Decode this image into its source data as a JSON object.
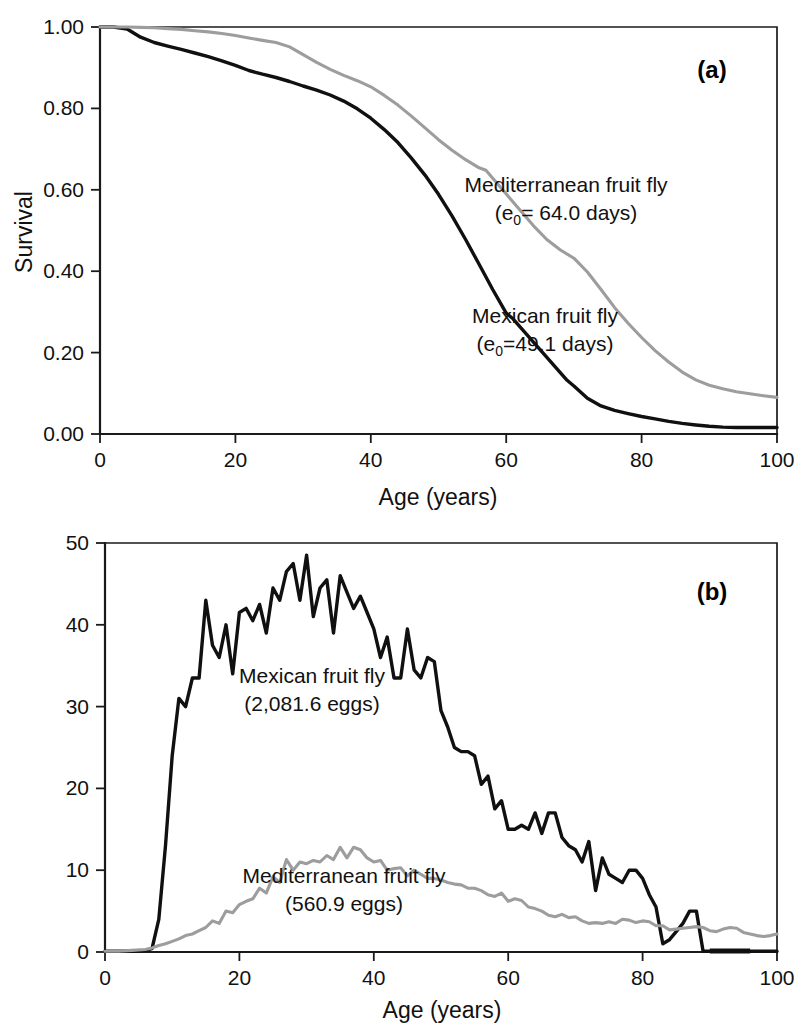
{
  "figure": {
    "panels": [
      {
        "tag": "(a)",
        "xlabel": "Age (years)",
        "ylabel": "Survival",
        "xticks": [
          "0",
          "20",
          "40",
          "60",
          "80",
          "100"
        ],
        "yticks": [
          "0.00",
          "0.20",
          "0.40",
          "0.60",
          "0.80",
          "1.00"
        ],
        "annotations": [
          {
            "line1": "Mediterranean fruit fly",
            "pre": "(e",
            "sub": "0",
            "post": "= 64.0 days)"
          },
          {
            "line1": "Mexican fruit fly",
            "pre": "(e",
            "sub": "0",
            "post": "=49.1 days)"
          }
        ]
      },
      {
        "tag": "(b)",
        "xlabel": "Age (years)",
        "ylabel": "Eggs/female",
        "xticks": [
          "0",
          "20",
          "40",
          "60",
          "80",
          "100"
        ],
        "yticks": [
          "0",
          "10",
          "20",
          "30",
          "40",
          "50"
        ],
        "annotations": [
          {
            "line1": "Mexican fruit fly",
            "line2": "(2,081.6 eggs)"
          },
          {
            "line1": "Mediterranean fruit fly",
            "line2": "(560.9 eggs)"
          }
        ]
      }
    ],
    "colors": {
      "mexican": "#101010",
      "mediterranean": "#9d9d9d",
      "axis": "#1a1a1a"
    }
  },
  "chart_data": [
    {
      "type": "line",
      "panel": "(a)",
      "title": "",
      "xlabel": "Age (years)",
      "ylabel": "Survival",
      "xlim": [
        0,
        100
      ],
      "ylim": [
        0.0,
        1.0
      ],
      "xticks": [
        0,
        20,
        40,
        60,
        80,
        100
      ],
      "yticks": [
        0.0,
        0.2,
        0.4,
        0.6,
        0.8,
        1.0
      ],
      "grid": false,
      "legend": "inline-annotations",
      "series": [
        {
          "name": "Mexican fruit fly",
          "color": "#101010",
          "annotation": "Mexican fruit fly (e0=49.1 days)",
          "life_expectancy_days": 49.1,
          "x": [
            0,
            2,
            4,
            6,
            8,
            10,
            12,
            14,
            16,
            18,
            20,
            22,
            24,
            26,
            28,
            30,
            32,
            34,
            36,
            38,
            40,
            42,
            44,
            46,
            48,
            50,
            52,
            54,
            56,
            58,
            60,
            61,
            69,
            70,
            72,
            74,
            76,
            78,
            80,
            82,
            84,
            86,
            88,
            90,
            92,
            94,
            96,
            98,
            100
          ],
          "y": [
            1.0,
            1.0,
            0.995,
            0.975,
            0.962,
            0.953,
            0.945,
            0.936,
            0.927,
            0.917,
            0.906,
            0.893,
            0.884,
            0.876,
            0.866,
            0.855,
            0.845,
            0.833,
            0.818,
            0.799,
            0.776,
            0.748,
            0.716,
            0.678,
            0.636,
            0.589,
            0.536,
            0.478,
            0.417,
            0.355,
            0.297,
            0.283,
            0.132,
            0.118,
            0.088,
            0.069,
            0.058,
            0.05,
            0.043,
            0.037,
            0.031,
            0.026,
            0.022,
            0.019,
            0.017,
            0.016,
            0.016,
            0.016,
            0.016
          ]
        },
        {
          "name": "Mediterranean fruit fly",
          "color": "#9d9d9d",
          "annotation": "Mediterranean fruit fly (e0= 64.0 days)",
          "life_expectancy_days": 64.0,
          "x": [
            0,
            2,
            4,
            6,
            8,
            10,
            12,
            14,
            16,
            18,
            20,
            22,
            24,
            26,
            28,
            30,
            32,
            34,
            36,
            38,
            40,
            42,
            44,
            46,
            48,
            50,
            52,
            54,
            56,
            57,
            64,
            66,
            68,
            70,
            72,
            74,
            76,
            78,
            80,
            82,
            84,
            86,
            88,
            90,
            92,
            94,
            96,
            98,
            100
          ],
          "y": [
            1.0,
            1.0,
            1.0,
            0.999,
            0.998,
            0.996,
            0.994,
            0.991,
            0.988,
            0.984,
            0.979,
            0.973,
            0.967,
            0.962,
            0.951,
            0.932,
            0.913,
            0.896,
            0.881,
            0.868,
            0.853,
            0.832,
            0.808,
            0.781,
            0.752,
            0.723,
            0.697,
            0.674,
            0.654,
            0.648,
            0.512,
            0.478,
            0.452,
            0.432,
            0.398,
            0.355,
            0.311,
            0.272,
            0.237,
            0.205,
            0.177,
            0.152,
            0.133,
            0.12,
            0.111,
            0.104,
            0.099,
            0.094,
            0.09
          ]
        }
      ]
    },
    {
      "type": "line",
      "panel": "(b)",
      "title": "",
      "xlabel": "Age (years)",
      "ylabel": "Eggs/female",
      "xlim": [
        0,
        100
      ],
      "ylim": [
        0,
        50
      ],
      "xticks": [
        0,
        20,
        40,
        60,
        80,
        100
      ],
      "yticks": [
        0,
        10,
        20,
        30,
        40,
        50
      ],
      "grid": false,
      "legend": "inline-annotations",
      "series": [
        {
          "name": "Mexican fruit fly",
          "color": "#101010",
          "annotation": "Mexican fruit fly (2,081.6 eggs)",
          "total_eggs": 2081.6,
          "x": [
            0,
            2,
            4,
            6,
            7,
            8,
            9,
            10,
            11,
            12,
            13,
            14,
            15,
            16,
            17,
            18,
            19,
            20,
            21,
            22,
            23,
            24,
            25,
            26,
            27,
            28,
            29,
            30,
            31,
            32,
            33,
            34,
            35,
            36,
            37,
            38,
            39,
            40,
            41,
            42,
            43,
            44,
            45,
            46,
            47,
            48,
            49,
            50,
            51,
            52,
            53,
            54,
            55,
            56,
            57,
            58,
            59,
            60,
            61,
            62,
            63,
            64,
            65,
            66,
            67,
            68,
            69,
            70,
            71,
            72,
            73,
            74,
            75,
            76,
            77,
            78,
            79,
            80,
            81,
            82,
            83,
            84,
            85,
            86,
            87,
            88,
            89,
            90,
            92,
            94,
            96,
            98,
            100
          ],
          "y": [
            0.1,
            0.1,
            0.1,
            0.2,
            0.4,
            4.0,
            13.0,
            24.0,
            31.0,
            30.0,
            33.5,
            33.5,
            43.0,
            37.5,
            36.0,
            40.0,
            34.0,
            41.5,
            42.0,
            40.5,
            42.5,
            39.0,
            44.5,
            43.0,
            46.5,
            47.5,
            43.0,
            48.5,
            41.0,
            44.5,
            45.5,
            39.0,
            46.0,
            44.0,
            42.0,
            43.5,
            41.5,
            39.5,
            36.0,
            38.5,
            33.5,
            33.5,
            39.5,
            34.5,
            33.5,
            36.0,
            35.5,
            29.5,
            27.5,
            25.0,
            24.5,
            24.5,
            24.0,
            20.5,
            21.5,
            17.5,
            18.5,
            15.0,
            15.0,
            15.5,
            15.0,
            17.0,
            14.5,
            17.0,
            17.0,
            14.0,
            13.0,
            12.5,
            11.0,
            13.5,
            7.5,
            11.5,
            9.5,
            9.0,
            8.5,
            10.0,
            10.0,
            9.0,
            7.0,
            5.5,
            1.0,
            1.5,
            2.5,
            3.5,
            5.0,
            5.0,
            0.1,
            0.1,
            0.1,
            0.1,
            0.1,
            0.1,
            0.1
          ]
        },
        {
          "name": "Mediterranean fruit fly",
          "color": "#9d9d9d",
          "annotation": "Mediterranean fruit fly (560.9 eggs)",
          "total_eggs": 560.9,
          "x": [
            0,
            2,
            4,
            6,
            7,
            8,
            9,
            10,
            11,
            12,
            13,
            14,
            15,
            16,
            17,
            18,
            19,
            20,
            21,
            22,
            23,
            24,
            25,
            26,
            27,
            28,
            29,
            30,
            31,
            32,
            33,
            34,
            35,
            36,
            37,
            38,
            39,
            40,
            41,
            42,
            43,
            44,
            45,
            46,
            47,
            48,
            49,
            50,
            51,
            52,
            53,
            54,
            55,
            56,
            57,
            58,
            59,
            60,
            61,
            62,
            63,
            64,
            65,
            66,
            67,
            68,
            69,
            70,
            71,
            72,
            73,
            74,
            75,
            76,
            77,
            78,
            79,
            80,
            81,
            82,
            83,
            84,
            85,
            86,
            87,
            88,
            89,
            90,
            91,
            92,
            93,
            94,
            95,
            96,
            97,
            98,
            99,
            100
          ],
          "y": [
            0.1,
            0.1,
            0.2,
            0.3,
            0.5,
            0.8,
            1.0,
            1.3,
            1.6,
            2.0,
            2.2,
            2.6,
            3.0,
            3.8,
            3.5,
            5.0,
            4.8,
            5.8,
            6.2,
            6.5,
            7.8,
            7.2,
            9.2,
            8.5,
            11.3,
            10.0,
            11.0,
            10.8,
            11.2,
            11.0,
            11.8,
            11.3,
            12.8,
            11.5,
            12.8,
            12.5,
            11.5,
            11.0,
            11.2,
            10.0,
            10.2,
            10.3,
            9.3,
            10.0,
            9.5,
            9.0,
            9.0,
            8.8,
            8.5,
            8.3,
            8.2,
            7.8,
            7.8,
            7.5,
            7.0,
            6.8,
            7.2,
            6.2,
            6.5,
            6.3,
            5.5,
            5.3,
            5.0,
            4.5,
            4.3,
            4.6,
            4.2,
            4.3,
            3.8,
            3.5,
            3.6,
            3.5,
            3.7,
            3.5,
            4.0,
            3.9,
            3.6,
            3.8,
            3.7,
            3.2,
            3.2,
            2.7,
            2.8,
            2.9,
            3.0,
            3.1,
            3.0,
            2.6,
            2.5,
            2.8,
            3.0,
            2.9,
            2.4,
            2.2,
            2.0,
            1.9,
            2.0,
            2.2
          ]
        }
      ]
    }
  ]
}
